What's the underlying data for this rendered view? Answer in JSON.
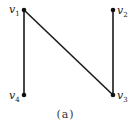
{
  "diagram": {
    "type": "graph",
    "caption": "(a)",
    "nodes": [
      {
        "id": "v1",
        "label": "v",
        "sub": "1",
        "x": 24,
        "y": 10
      },
      {
        "id": "v2",
        "label": "v",
        "sub": "2",
        "x": 113,
        "y": 10
      },
      {
        "id": "v3",
        "label": "v",
        "sub": "3",
        "x": 113,
        "y": 95
      },
      {
        "id": "v4",
        "label": "v",
        "sub": "4",
        "x": 24,
        "y": 95
      }
    ],
    "edges": [
      {
        "from": "v1",
        "to": "v4"
      },
      {
        "from": "v1",
        "to": "v3"
      },
      {
        "from": "v2",
        "to": "v3"
      }
    ],
    "colors": {
      "edge": "#1a1a1a",
      "node": "#111111"
    }
  }
}
